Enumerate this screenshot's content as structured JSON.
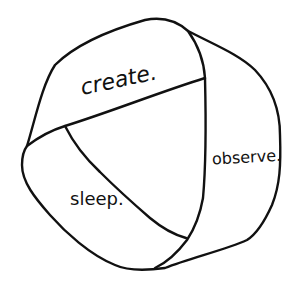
{
  "diagram": {
    "type": "hand-drawn ball divided into three regions",
    "regions": [
      {
        "id": "create",
        "label": "create."
      },
      {
        "id": "observe",
        "label": "observe."
      },
      {
        "id": "sleep",
        "label": "sleep."
      }
    ],
    "colors": {
      "background": "#ffffff",
      "ink": "#111111"
    }
  }
}
